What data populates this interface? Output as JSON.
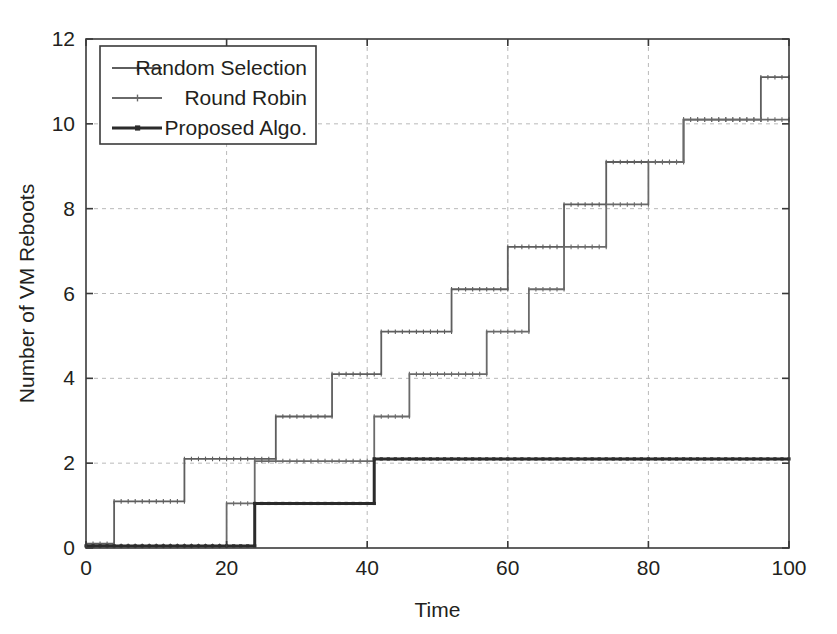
{
  "chart_data": {
    "type": "line",
    "subtype": "step",
    "title": "",
    "xlabel": "Time",
    "ylabel": "Number of VM Reboots",
    "xlim": [
      0,
      100
    ],
    "ylim": [
      0,
      12
    ],
    "xticks": [
      0,
      20,
      40,
      60,
      80,
      100
    ],
    "yticks": [
      0,
      2,
      4,
      6,
      8,
      10,
      12
    ],
    "xtick_labels": [
      "0",
      "20",
      "40",
      "60",
      "80",
      "100"
    ],
    "ytick_labels": [
      "0",
      "2",
      "4",
      "6",
      "8",
      "10",
      "12"
    ],
    "grid": true,
    "grid_style": "dashed",
    "legend_position": "top-left",
    "series": [
      {
        "name": "Random Selection",
        "color": "#5e5e5e",
        "width": 1.8,
        "marker": "plus",
        "x": [
          0,
          4,
          4,
          14,
          14,
          27,
          27,
          35,
          35,
          42,
          42,
          52,
          52,
          60,
          60,
          68,
          68,
          74,
          74,
          85,
          85,
          96,
          96,
          100
        ],
        "y": [
          0.1,
          0.1,
          1.1,
          1.1,
          2.1,
          2.1,
          3.1,
          3.1,
          4.1,
          4.1,
          5.1,
          5.1,
          6.1,
          6.1,
          7.1,
          7.1,
          8.1,
          8.1,
          9.1,
          9.1,
          10.1,
          10.1,
          11.1,
          11.1
        ]
      },
      {
        "name": "Round Robin",
        "color": "#6a6a6a",
        "width": 1.8,
        "marker": "plus",
        "x": [
          0,
          20,
          20,
          24,
          24,
          41,
          41,
          46,
          46,
          57,
          57,
          63,
          63,
          68,
          68,
          74,
          74,
          80,
          80,
          85,
          85,
          91,
          91,
          96,
          96,
          100
        ],
        "y": [
          0.05,
          0.05,
          1.05,
          1.05,
          2.05,
          2.05,
          3.1,
          3.1,
          4.1,
          4.1,
          5.1,
          5.1,
          6.1,
          6.1,
          7.1,
          7.1,
          8.1,
          8.1,
          9.1,
          9.1,
          10.1,
          10.1,
          10.1,
          10.1,
          10.1,
          10.1
        ]
      },
      {
        "name": "Proposed Algo.",
        "color": "#2b2b2b",
        "width": 3.0,
        "marker": "square",
        "x": [
          0,
          24,
          24,
          41,
          41,
          100
        ],
        "y": [
          0.05,
          0.05,
          1.05,
          1.05,
          2.1,
          2.1
        ]
      }
    ]
  },
  "legend": {
    "entries": [
      {
        "label": "Random Selection"
      },
      {
        "label": "Round Robin"
      },
      {
        "label": "Proposed Algo."
      }
    ]
  },
  "axes": {
    "x_title": "Time",
    "y_title": "Number of VM Reboots"
  }
}
